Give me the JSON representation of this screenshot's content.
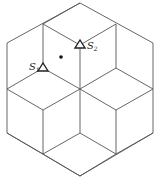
{
  "diagram": {
    "stroke_color": "#555555",
    "sensors": [
      {
        "id": "S1",
        "label": "S",
        "subscript": "1",
        "x": 43,
        "y": 68
      },
      {
        "id": "S2",
        "label": "S",
        "subscript": "2",
        "x": 80,
        "y": 45
      }
    ],
    "point": {
      "x": 61,
      "y": 57
    }
  }
}
